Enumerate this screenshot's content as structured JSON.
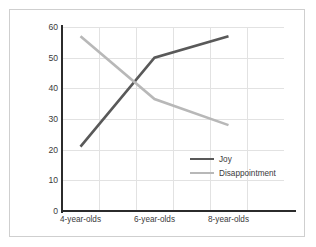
{
  "chart_data": {
    "type": "line",
    "title": "",
    "xlabel": "",
    "ylabel": "Percent expressing the emotion when given an unattractive toy",
    "ylabel_lines": [
      "Percent expressing the emotion",
      "when given an unattractive toy"
    ],
    "categories": [
      "4-year-olds",
      "6-year-olds",
      "8-year-olds"
    ],
    "series": [
      {
        "name": "Joy",
        "values": [
          21,
          50,
          57
        ],
        "color": "#595959"
      },
      {
        "name": "Disappointment",
        "values": [
          57,
          36.5,
          28
        ],
        "color": "#b8b8b8"
      }
    ],
    "ylim": [
      0,
      60
    ],
    "yticks": [
      60,
      50,
      40,
      30,
      20,
      10,
      0
    ],
    "ytick_labels": [
      "60",
      "50",
      "40",
      "30",
      "20",
      "10",
      "0"
    ],
    "grid": true,
    "legend_position": "center-right"
  },
  "legend": {
    "entries": [
      {
        "label": "Joy"
      },
      {
        "label": "Disappointment"
      }
    ]
  },
  "colors": {
    "joy": "#595959",
    "disappointment": "#b8b8b8",
    "axis": "#2b2b2b",
    "grid": "#e2e2e2",
    "frame": "#cfcfcf",
    "text": "#3a3a3a",
    "background": "#ffffff"
  }
}
